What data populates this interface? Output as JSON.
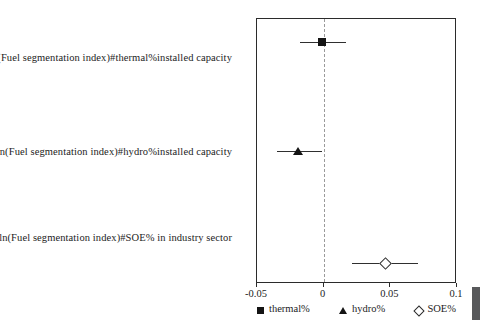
{
  "chart_data": {
    "type": "scatter",
    "subtype": "coefficient-plot-with-confidence-intervals",
    "title": "",
    "subtitle": "",
    "xlabel": "",
    "ylabel": "",
    "xlim": [
      -0.05,
      0.1
    ],
    "grid": false,
    "reference_line": {
      "value": 0,
      "style": "dashed",
      "color": "#9a9a9a"
    },
    "xticks": [
      -0.05,
      0,
      0.05,
      0.1
    ],
    "xtick_labels": [
      "-0.05",
      "0",
      "0.05",
      "0.1"
    ],
    "categories": [
      "ln(Fuel segmentation index)#thermal%installed capacity",
      "ln(Fuel segmentation index)#hydro%installed capacity",
      "ln(Fuel segmentation index)#SOE% in industry sector"
    ],
    "legend_position": "bottom",
    "legend": [
      {
        "label": "thermal%",
        "marker": "filled-square",
        "color": "#141414"
      },
      {
        "label": "hydro%",
        "marker": "filled-triangle",
        "color": "#141414"
      },
      {
        "label": "SOE%",
        "marker": "open-diamond",
        "color": "#2b2b2b"
      }
    ],
    "series": [
      {
        "name": "thermal%",
        "marker": "filled-square",
        "category": "ln(Fuel segmentation index)#thermal%installed capacity",
        "estimate": -0.001,
        "ci_low": -0.018,
        "ci_high": 0.017
      },
      {
        "name": "hydro%",
        "marker": "filled-triangle",
        "category": "ln(Fuel segmentation index)#hydro%installed capacity",
        "estimate": -0.0195,
        "ci_low": -0.035,
        "ci_high": -0.0015
      },
      {
        "name": "SOE%",
        "marker": "open-diamond",
        "category": "ln(Fuel segmentation index)#SOE% in industry sector",
        "estimate": 0.046,
        "ci_low": 0.021,
        "ci_high": 0.071
      }
    ],
    "row_y_px": [
      41,
      150,
      262
    ]
  }
}
